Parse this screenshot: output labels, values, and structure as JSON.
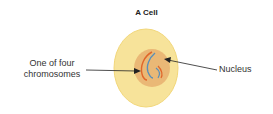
{
  "title": "A Cell",
  "labels": {
    "chromosome": [
      "One of four",
      "chromosomes"
    ],
    "nucleus": "Nucleus"
  },
  "colors": {
    "cytoplasm": "#f7e39a",
    "cytoplasm_edge": "#f2d77a",
    "nucleus": "#e8b070",
    "chromosome_orange": "#e0662a",
    "chromosome_blue": "#5a8fb8",
    "arrow": "#222222"
  }
}
